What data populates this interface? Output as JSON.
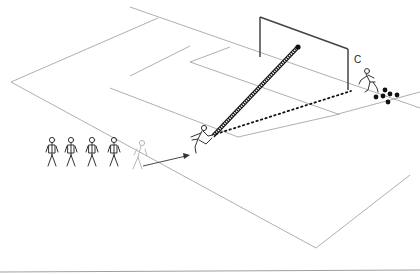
{
  "diagram": {
    "type": "soccer-drill",
    "labels": {
      "coach": "C"
    },
    "colors": {
      "pitch_lines": "#9a9a9a",
      "goal": "#444444",
      "ball": "#111111",
      "pass_path": "#111111",
      "player_outline": "#333333",
      "ghost_player": "#b8b8b8"
    },
    "elements": {
      "queue_players": 4,
      "ghost_player": 1,
      "shooter": 1,
      "coach": 1,
      "balls_at_coach": 6,
      "ball_in_goal": 1,
      "paths": [
        {
          "type": "run",
          "style": "solid-arrow",
          "from": "queue",
          "to": "shooter"
        },
        {
          "type": "pass",
          "style": "dotted",
          "from": "coach",
          "to": "shooter"
        },
        {
          "type": "shot",
          "style": "checkered",
          "from": "shooter",
          "to": "goal"
        }
      ]
    }
  }
}
